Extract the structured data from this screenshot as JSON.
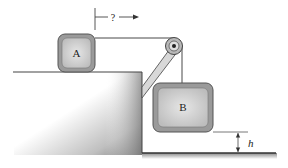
{
  "diagram": {
    "type": "physics-pulley-system",
    "blocks": [
      {
        "id": "A",
        "label": "A",
        "location": "on horizontal table top"
      },
      {
        "id": "B",
        "label": "B",
        "location": "hanging from pulley over floor"
      }
    ],
    "unknown_marker": {
      "label": "?",
      "meaning": "horizontal displacement of block A (arrow pointing right)"
    },
    "height_marker": {
      "label": "h",
      "meaning": "height of block B above the floor"
    },
    "components": [
      "table",
      "strut",
      "pulley",
      "rope",
      "floor"
    ],
    "colors": {
      "block_fill": "#c8c8c8",
      "block_border": "#6e6e6e",
      "line": "#333333",
      "strut_fill": "#d8d8d8"
    }
  }
}
